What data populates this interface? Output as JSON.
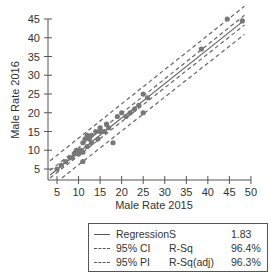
{
  "chart_data": {
    "type": "scatter",
    "title": "",
    "xlabel": "Male Rate 2015",
    "ylabel": "Male Rate 2016",
    "xlim": [
      3.4,
      50
    ],
    "ylim": [
      2.1,
      45
    ],
    "x_ticks": [
      5,
      10,
      15,
      20,
      25,
      30,
      35,
      40,
      45,
      50
    ],
    "y_ticks": [
      5,
      10,
      15,
      20,
      25,
      30,
      35,
      40,
      45
    ],
    "grid": false,
    "legend_position": "below",
    "points": [
      [
        5,
        5
      ],
      [
        6,
        6
      ],
      [
        7,
        7
      ],
      [
        8,
        8
      ],
      [
        8.5,
        8
      ],
      [
        9,
        9
      ],
      [
        9.5,
        10
      ],
      [
        10,
        9
      ],
      [
        10.5,
        10
      ],
      [
        11,
        9.5
      ],
      [
        11,
        12
      ],
      [
        11.5,
        13
      ],
      [
        12,
        11
      ],
      [
        12,
        14
      ],
      [
        12.5,
        13
      ],
      [
        13,
        12
      ],
      [
        13,
        14
      ],
      [
        14,
        15
      ],
      [
        14.5,
        13
      ],
      [
        15,
        16
      ],
      [
        15,
        15
      ],
      [
        16,
        15
      ],
      [
        16.5,
        17
      ],
      [
        17,
        16
      ],
      [
        11,
        7
      ],
      [
        18,
        12
      ],
      [
        19,
        19
      ],
      [
        20,
        20
      ],
      [
        21,
        19
      ],
      [
        22,
        20
      ],
      [
        23,
        21
      ],
      [
        24,
        22
      ],
      [
        25,
        20
      ],
      [
        25,
        25
      ],
      [
        26,
        24
      ],
      [
        38.5,
        37
      ],
      [
        44.5,
        45
      ],
      [
        48,
        44.5
      ]
    ],
    "series": [
      {
        "name": "Regression",
        "style": "solid",
        "line": {
          "x": [
            3.4,
            48.5
          ],
          "y": [
            3.4,
            44.7
          ]
        }
      },
      {
        "name": "95% CI",
        "style": "dashed",
        "upper": {
          "x": [
            3.4,
            48.5
          ],
          "y": [
            4.6,
            46.0
          ]
        },
        "lower": {
          "x": [
            3.4,
            48.5
          ],
          "y": [
            2.2,
            43.4
          ]
        }
      },
      {
        "name": "95% PI",
        "style": "dashed",
        "upper": {
          "x": [
            3.4,
            48.5
          ],
          "y": [
            7.2,
            48.4
          ]
        },
        "lower": {
          "x": [
            3.4,
            48.5
          ],
          "y": [
            -0.4,
            40.9
          ]
        }
      }
    ],
    "stats": {
      "S": "1.83",
      "R-Sq": "96.4%",
      "R-Sq(adj)": "96.3%"
    }
  },
  "legend": {
    "rows": [
      {
        "name": "Regression",
        "stat": "S",
        "value": "1.83",
        "style": "solid"
      },
      {
        "name": "95% CI",
        "stat": "R-Sq",
        "value": "96.4%",
        "style": "dashed"
      },
      {
        "name": "95% PI",
        "stat": "R-Sq(adj)",
        "value": "96.3%",
        "style": "dashed"
      }
    ]
  },
  "colors": {
    "axis": "#555555",
    "point": "#777777",
    "line": "#666666"
  }
}
